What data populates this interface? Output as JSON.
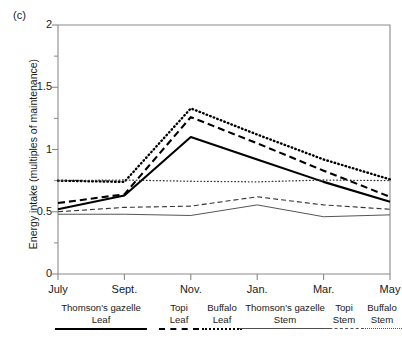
{
  "figure": {
    "panel_label": "(c)"
  },
  "chart_data": {
    "type": "line",
    "title": "",
    "panel": "(c)",
    "xlabel": "",
    "ylabel": "Energy intake (multiples of maintenance)",
    "categories": [
      "July",
      "Sept.",
      "Nov.",
      "Jan.",
      "Mar.",
      "May"
    ],
    "x_tick_labels": [
      "July",
      "Sept.",
      "Nov.",
      "Jan.",
      "Mar.",
      "May"
    ],
    "y_tick_labels": [
      "0",
      "0.5",
      "1",
      "1.5",
      "2"
    ],
    "y_tick_values": [
      0,
      0.5,
      1,
      1.5,
      2
    ],
    "ylim": [
      0,
      2
    ],
    "y_minor_ticks": [
      0.25,
      0.75,
      1.25,
      1.75
    ],
    "grid": false,
    "legend_position": "below",
    "series": [
      {
        "name": "Thomson's gazelle Leaf",
        "animal": "Thomson's gazelle",
        "plant_part": "Leaf",
        "style": "solid-thick",
        "values": [
          0.52,
          0.63,
          1.1,
          0.92,
          0.74,
          0.58
        ]
      },
      {
        "name": "Topi Leaf",
        "animal": "Topi",
        "plant_part": "Leaf",
        "style": "dashed-thick",
        "values": [
          0.57,
          0.64,
          1.26,
          1.05,
          0.83,
          0.62
        ]
      },
      {
        "name": "Buffalo Leaf",
        "animal": "Buffalo",
        "plant_part": "Leaf",
        "style": "dotted-thick",
        "values": [
          0.75,
          0.74,
          1.33,
          1.12,
          0.92,
          0.76
        ]
      },
      {
        "name": "Thomson's gazelle Stem",
        "animal": "Thomson's gazelle",
        "plant_part": "Stem",
        "style": "solid-thin",
        "values": [
          0.48,
          0.48,
          0.47,
          0.555,
          0.46,
          0.475
        ]
      },
      {
        "name": "Topi Stem",
        "animal": "Topi",
        "plant_part": "Stem",
        "style": "dashed-thin",
        "values": [
          0.5,
          0.535,
          0.545,
          0.62,
          0.555,
          0.52
        ]
      },
      {
        "name": "Buffalo Stem",
        "animal": "Buffalo",
        "plant_part": "Stem",
        "style": "dotted-thin",
        "values": [
          0.75,
          0.755,
          0.745,
          0.74,
          0.755,
          0.75
        ]
      }
    ]
  },
  "legend": {
    "entries": [
      {
        "name": "Thomson's gazelle",
        "part": "Leaf",
        "style": "solid-thick",
        "width": 92
      },
      {
        "name": "Topi",
        "part": "Leaf",
        "style": "dashed-thick",
        "width": 40
      },
      {
        "name": "Buffalo",
        "part": "Leaf",
        "style": "dotted-thick",
        "width": 40
      },
      {
        "name": "Thomson's gazelle",
        "part": "Stem",
        "style": "solid-thin",
        "width": 92
      },
      {
        "name": "Topi",
        "part": "Stem",
        "style": "dashed-thin",
        "width": 40
      },
      {
        "name": "Buffalo",
        "part": "Stem",
        "style": "dotted-thin",
        "width": 40
      }
    ]
  }
}
